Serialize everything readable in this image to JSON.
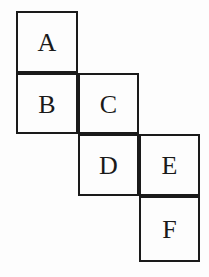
{
  "figure": {
    "kind": "cube-net-diagram",
    "width": 209,
    "height": 277,
    "background_color": "#fdfdfd",
    "line_color": "#1a1a1a",
    "label_color": "#1a1a1a",
    "cells": [
      {
        "label": "A",
        "x": 16,
        "y": 11,
        "w": 62,
        "h": 62
      },
      {
        "label": "B",
        "x": 16,
        "y": 73,
        "w": 62,
        "h": 61
      },
      {
        "label": "C",
        "x": 78,
        "y": 73,
        "w": 61,
        "h": 61
      },
      {
        "label": "D",
        "x": 78,
        "y": 134,
        "w": 61,
        "h": 62
      },
      {
        "label": "E",
        "x": 139,
        "y": 134,
        "w": 61,
        "h": 62
      },
      {
        "label": "F",
        "x": 139,
        "y": 196,
        "w": 61,
        "h": 66
      }
    ]
  }
}
